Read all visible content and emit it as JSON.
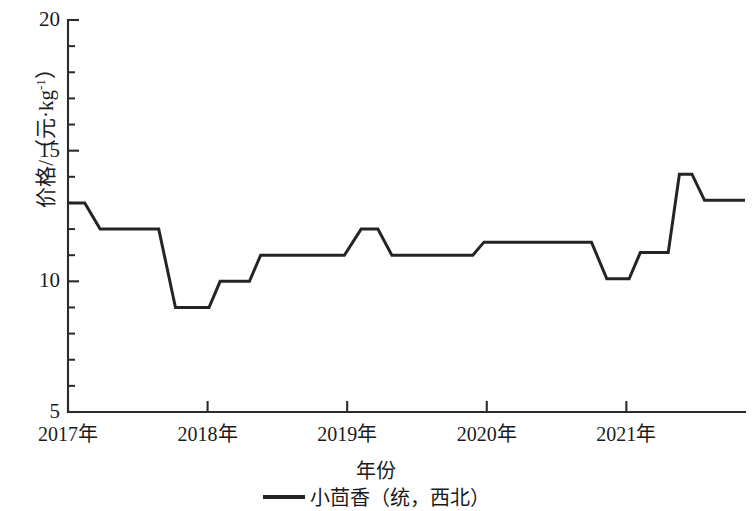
{
  "chart_data": {
    "type": "line",
    "title": "",
    "xlabel": "年份",
    "ylabel": "价格/（元·kg⁻¹）",
    "ylabel_parts": {
      "prefix": "价格/（元·kg",
      "exponent": "-1",
      "suffix": "）"
    },
    "xlim": [
      2017.0,
      2021.85
    ],
    "ylim": [
      5,
      20
    ],
    "yticks": [
      5,
      10,
      15,
      20
    ],
    "ytick_labels": [
      "5",
      "10",
      "15",
      "20"
    ],
    "yminor_step": 1,
    "xticks": [
      2017,
      2018,
      2019,
      2020,
      2021
    ],
    "xtick_labels": [
      "2017年",
      "2018年",
      "2019年",
      "2020年",
      "2021年"
    ],
    "grid": false,
    "legend_position": "bottom-center",
    "series": [
      {
        "name": "小茴香（统，西北）",
        "color": "#242424",
        "step_style": "flat-plateaus-with-sloped-transitions",
        "points": [
          {
            "x": 2017.0,
            "y": 13.0
          },
          {
            "x": 2017.12,
            "y": 13.0
          },
          {
            "x": 2017.23,
            "y": 12.0
          },
          {
            "x": 2017.65,
            "y": 12.0
          },
          {
            "x": 2017.77,
            "y": 9.0
          },
          {
            "x": 2018.01,
            "y": 9.0
          },
          {
            "x": 2018.09,
            "y": 10.0
          },
          {
            "x": 2018.3,
            "y": 10.0
          },
          {
            "x": 2018.38,
            "y": 11.0
          },
          {
            "x": 2018.98,
            "y": 11.0
          },
          {
            "x": 2019.1,
            "y": 12.0
          },
          {
            "x": 2019.22,
            "y": 12.0
          },
          {
            "x": 2019.32,
            "y": 11.0
          },
          {
            "x": 2019.9,
            "y": 11.0
          },
          {
            "x": 2019.98,
            "y": 11.5
          },
          {
            "x": 2020.75,
            "y": 11.5
          },
          {
            "x": 2020.86,
            "y": 10.1
          },
          {
            "x": 2021.02,
            "y": 10.1
          },
          {
            "x": 2021.1,
            "y": 11.1
          },
          {
            "x": 2021.3,
            "y": 11.1
          },
          {
            "x": 2021.38,
            "y": 14.1
          },
          {
            "x": 2021.47,
            "y": 14.1
          },
          {
            "x": 2021.56,
            "y": 13.1
          },
          {
            "x": 2021.85,
            "y": 13.1
          }
        ]
      }
    ],
    "annotations": []
  },
  "legend": {
    "entries": [
      {
        "label": "小茴香（统，西北）",
        "color": "#242424",
        "marker": "line"
      }
    ]
  },
  "axes": {
    "y_ticks_labeled": [
      "20",
      "15",
      "10",
      "5"
    ],
    "x_ticks_labeled": [
      "2017年",
      "2018年",
      "2019年",
      "2020年",
      "2021年"
    ]
  }
}
